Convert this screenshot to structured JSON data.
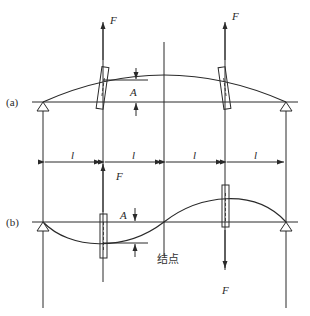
{
  "diagram": {
    "type": "structural vibration mode shapes (two-span beam with nodal point)",
    "labels": {
      "part_a": "(a)",
      "part_b": "(b)",
      "force": "F",
      "amplitude": "A",
      "span": "l",
      "node": "结点"
    },
    "spans": [
      "l",
      "l",
      "l",
      "l"
    ],
    "colors": {
      "line": "#2a2a2a",
      "background": "#ffffff"
    }
  }
}
